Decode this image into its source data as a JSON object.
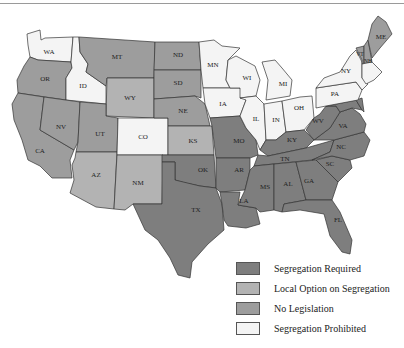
{
  "colors": {
    "required": "#7e7e7e",
    "local_option": "#b3b3b3",
    "no_legislation": "#9d9d9d",
    "prohibited": "#f4f4f4"
  },
  "legend": {
    "items": [
      {
        "label": "Segregation Required",
        "category": "required"
      },
      {
        "label": "Local Option on Segregation",
        "category": "local_option"
      },
      {
        "label": "No Legislation",
        "category": "no_legislation"
      },
      {
        "label": "Segregation Prohibited",
        "category": "prohibited"
      }
    ]
  },
  "states": {
    "WA": "prohibited",
    "OR": "no_legislation",
    "CA": "no_legislation",
    "ID": "prohibited",
    "NV": "no_legislation",
    "MT": "no_legislation",
    "WY": "local_option",
    "UT": "no_legislation",
    "AZ": "local_option",
    "CO": "prohibited",
    "NM": "local_option",
    "ND": "no_legislation",
    "SD": "no_legislation",
    "NE": "no_legislation",
    "KS": "local_option",
    "OK": "required",
    "TX": "required",
    "MN": "prohibited",
    "IA": "prohibited",
    "MO": "required",
    "AR": "required",
    "LA": "required",
    "WI": "prohibited",
    "IL": "prohibited",
    "MI": "prohibited",
    "IN": "prohibited",
    "OH": "prohibited",
    "KY": "required",
    "TN": "required",
    "MS": "required",
    "AL": "required",
    "GA": "required",
    "FL": "required",
    "SC": "required",
    "NC": "required",
    "VA": "required",
    "WV": "required",
    "PA": "prohibited",
    "NY": "prohibited",
    "VT": "no_legislation",
    "NH": "no_legislation",
    "ME": "no_legislation",
    "MD": "required",
    "DE": "required"
  },
  "labels": {
    "WA": "WA",
    "OR": "OR",
    "CA": "CA",
    "ID": "ID",
    "NV": "NV",
    "MT": "MT",
    "WY": "WY",
    "UT": "UT",
    "AZ": "AZ",
    "CO": "CO",
    "NM": "NM",
    "ND": "ND",
    "SD": "SD",
    "NE": "NE",
    "KS": "KS",
    "OK": "OK",
    "TX": "TX",
    "MN": "MN",
    "IA": "IA",
    "MO": "MO",
    "AR": "AR",
    "LA": "LA",
    "WI": "WI",
    "IL": "IL",
    "MI": "MI",
    "IN": "IN",
    "OH": "OH",
    "KY": "KY",
    "TN": "TN",
    "MS": "MS",
    "AL": "AL",
    "GA": "GA",
    "FL": "FL",
    "SC": "SC",
    "NC": "NC",
    "VA": "VA",
    "WV": "WV",
    "PA": "PA",
    "NY": "NY",
    "VT": "VT",
    "NH": "NH",
    "ME": "ME"
  }
}
